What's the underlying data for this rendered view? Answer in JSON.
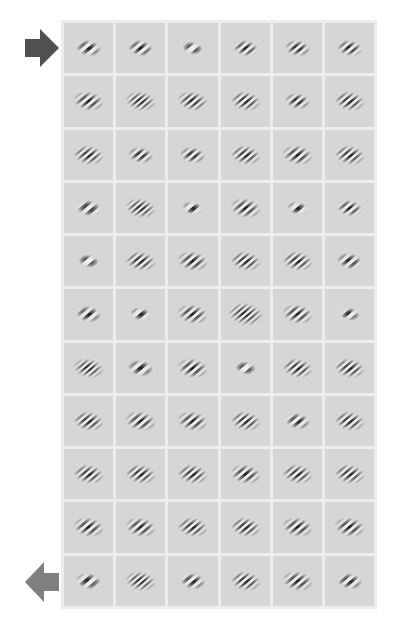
{
  "figure": {
    "rows": 11,
    "cols": 6,
    "colors": {
      "frame": "#ececec",
      "cell_bg": "#d6d6d6",
      "arrow_top": "#505050",
      "arrow_bottom": "#808080"
    },
    "markers": [
      {
        "name": "arrow-right",
        "row": 0,
        "direction": "right"
      },
      {
        "name": "arrow-left",
        "row": 10,
        "direction": "left"
      }
    ],
    "cells": [
      [
        {
          "a": -40,
          "f": 0.55,
          "s": 5,
          "p": 0
        },
        {
          "a": -40,
          "f": 0.6,
          "s": 5,
          "p": 1.5
        },
        {
          "a": -40,
          "f": 0.4,
          "s": 4,
          "p": 1.5
        },
        {
          "a": -40,
          "f": 0.7,
          "s": 5,
          "p": 0
        },
        {
          "a": -40,
          "f": 0.7,
          "s": 5,
          "p": 1
        },
        {
          "a": -40,
          "f": 0.7,
          "s": 5,
          "p": 0.5
        }
      ],
      [
        {
          "a": -40,
          "f": 0.7,
          "s": 6,
          "p": 0
        },
        {
          "a": -40,
          "f": 0.9,
          "s": 6,
          "p": 0
        },
        {
          "a": -40,
          "f": 0.8,
          "s": 6,
          "p": 1
        },
        {
          "a": -40,
          "f": 0.8,
          "s": 6,
          "p": 0
        },
        {
          "a": -40,
          "f": 0.7,
          "s": 5,
          "p": 1
        },
        {
          "a": -40,
          "f": 0.8,
          "s": 6,
          "p": 0
        }
      ],
      [
        {
          "a": -40,
          "f": 0.8,
          "s": 6,
          "p": 0
        },
        {
          "a": -40,
          "f": 0.7,
          "s": 5,
          "p": 1
        },
        {
          "a": -40,
          "f": 0.7,
          "s": 5,
          "p": 1
        },
        {
          "a": -40,
          "f": 0.8,
          "s": 6,
          "p": 0
        },
        {
          "a": -40,
          "f": 0.7,
          "s": 6,
          "p": 0
        },
        {
          "a": -40,
          "f": 0.8,
          "s": 6,
          "p": 0
        }
      ],
      [
        {
          "a": -40,
          "f": 0.5,
          "s": 5,
          "p": 0
        },
        {
          "a": -40,
          "f": 0.9,
          "s": 6,
          "p": 0
        },
        {
          "a": -40,
          "f": 0.45,
          "s": 4,
          "p": 1.5
        },
        {
          "a": -40,
          "f": 0.7,
          "s": 6,
          "p": 0
        },
        {
          "a": -40,
          "f": 0.45,
          "s": 4,
          "p": 1.5
        },
        {
          "a": -40,
          "f": 0.7,
          "s": 5,
          "p": 0
        }
      ],
      [
        {
          "a": -40,
          "f": 0.4,
          "s": 4,
          "p": 1.5
        },
        {
          "a": -40,
          "f": 0.8,
          "s": 6,
          "p": 0
        },
        {
          "a": -40,
          "f": 0.7,
          "s": 6,
          "p": 0
        },
        {
          "a": -40,
          "f": 0.8,
          "s": 6,
          "p": 0
        },
        {
          "a": -40,
          "f": 0.8,
          "s": 6,
          "p": 0
        },
        {
          "a": -40,
          "f": 0.6,
          "s": 5,
          "p": 0
        }
      ],
      [
        {
          "a": -40,
          "f": 0.55,
          "s": 5,
          "p": 0
        },
        {
          "a": -40,
          "f": 0.45,
          "s": 4,
          "p": 1.5
        },
        {
          "a": -40,
          "f": 0.7,
          "s": 6,
          "p": 0
        },
        {
          "a": -40,
          "f": 0.9,
          "s": 7,
          "p": 0
        },
        {
          "a": -40,
          "f": 0.7,
          "s": 6,
          "p": 0
        },
        {
          "a": -40,
          "f": 0.5,
          "s": 4,
          "p": 1.5
        }
      ],
      [
        {
          "a": -40,
          "f": 0.9,
          "s": 6,
          "p": 0
        },
        {
          "a": -40,
          "f": 0.5,
          "s": 5,
          "p": 1
        },
        {
          "a": -40,
          "f": 0.7,
          "s": 6,
          "p": 0
        },
        {
          "a": -40,
          "f": 0.4,
          "s": 4,
          "p": 1.5
        },
        {
          "a": -40,
          "f": 0.8,
          "s": 6,
          "p": 0
        },
        {
          "a": -40,
          "f": 0.8,
          "s": 6,
          "p": 0
        }
      ],
      [
        {
          "a": -40,
          "f": 0.8,
          "s": 6,
          "p": 0
        },
        {
          "a": -40,
          "f": 0.7,
          "s": 6,
          "p": 0
        },
        {
          "a": -40,
          "f": 0.7,
          "s": 6,
          "p": 0
        },
        {
          "a": -40,
          "f": 0.8,
          "s": 6,
          "p": 0
        },
        {
          "a": -40,
          "f": 0.6,
          "s": 5,
          "p": 1
        },
        {
          "a": -40,
          "f": 0.8,
          "s": 6,
          "p": 0
        }
      ],
      [
        {
          "a": -40,
          "f": 0.8,
          "s": 6,
          "p": 0
        },
        {
          "a": -40,
          "f": 0.8,
          "s": 6,
          "p": 0
        },
        {
          "a": -40,
          "f": 0.8,
          "s": 6,
          "p": 0
        },
        {
          "a": -40,
          "f": 0.7,
          "s": 6,
          "p": 0
        },
        {
          "a": -40,
          "f": 0.8,
          "s": 6,
          "p": 0
        },
        {
          "a": -40,
          "f": 0.8,
          "s": 6,
          "p": 0
        }
      ],
      [
        {
          "a": -40,
          "f": 0.7,
          "s": 6,
          "p": 0
        },
        {
          "a": -40,
          "f": 0.7,
          "s": 6,
          "p": 0
        },
        {
          "a": -40,
          "f": 0.8,
          "s": 6,
          "p": 0
        },
        {
          "a": -40,
          "f": 0.8,
          "s": 6,
          "p": 0
        },
        {
          "a": -40,
          "f": 0.7,
          "s": 6,
          "p": 0
        },
        {
          "a": -40,
          "f": 0.7,
          "s": 6,
          "p": 0
        }
      ],
      [
        {
          "a": -40,
          "f": 0.5,
          "s": 5,
          "p": 1.5
        },
        {
          "a": -40,
          "f": 0.9,
          "s": 6,
          "p": 0
        },
        {
          "a": -40,
          "f": 0.6,
          "s": 5,
          "p": 1
        },
        {
          "a": -40,
          "f": 0.8,
          "s": 6,
          "p": 0
        },
        {
          "a": -40,
          "f": 0.7,
          "s": 6,
          "p": 0
        },
        {
          "a": -40,
          "f": 0.6,
          "s": 5,
          "p": 1
        }
      ]
    ]
  }
}
